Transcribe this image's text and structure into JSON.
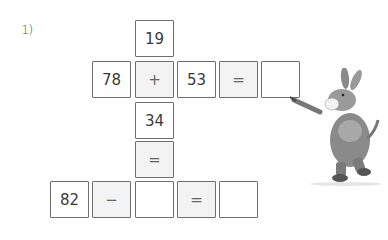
{
  "exercise": {
    "number_label": "1)",
    "cells": [
      {
        "id": "top",
        "value": "19",
        "type": "number",
        "col": 2,
        "row": 0
      },
      {
        "id": "r1c0",
        "value": "78",
        "type": "number",
        "col": 1,
        "row": 1
      },
      {
        "id": "r1c1",
        "value": "+",
        "type": "operator",
        "col": 2,
        "row": 1
      },
      {
        "id": "r1c2",
        "value": "53",
        "type": "number",
        "col": 3,
        "row": 1
      },
      {
        "id": "r1c3",
        "value": "=",
        "type": "operator",
        "col": 4,
        "row": 1
      },
      {
        "id": "r1c4",
        "value": "",
        "type": "answer",
        "col": 5,
        "row": 1
      },
      {
        "id": "r2",
        "value": "34",
        "type": "number",
        "col": 2,
        "row": 2
      },
      {
        "id": "r3",
        "value": "=",
        "type": "operator",
        "col": 2,
        "row": 3
      },
      {
        "id": "r4c0",
        "value": "82",
        "type": "number",
        "col": 0,
        "row": 4
      },
      {
        "id": "r4c1",
        "value": "−",
        "type": "operator",
        "col": 1,
        "row": 4
      },
      {
        "id": "r4c2",
        "value": "",
        "type": "answer",
        "col": 2,
        "row": 4
      },
      {
        "id": "r4c3",
        "value": "=",
        "type": "operator",
        "col": 3,
        "row": 4
      },
      {
        "id": "r4c4",
        "value": "",
        "type": "answer",
        "col": 4,
        "row": 4
      }
    ]
  },
  "illustration": {
    "subject": "donkey-pointing-icon"
  }
}
